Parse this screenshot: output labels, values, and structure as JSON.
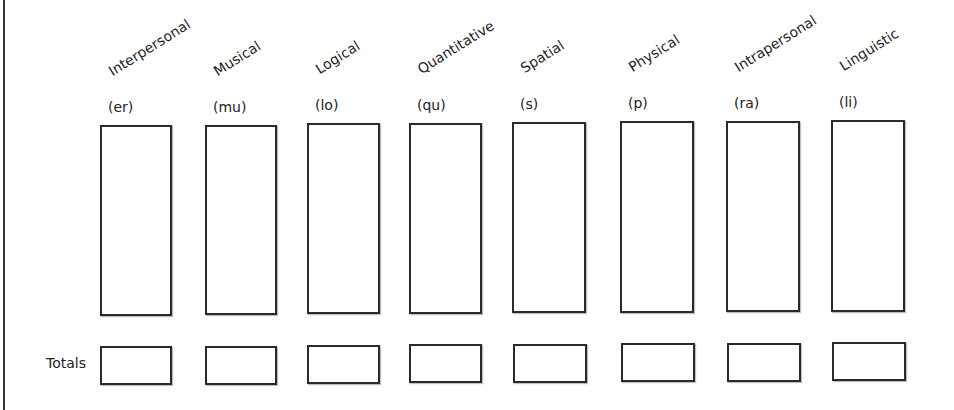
{
  "worksheet": {
    "totals_label": "Totals",
    "categories": [
      {
        "name": "Interpersonal",
        "abbr": "(er)",
        "x": 100,
        "w": 72,
        "top": 125,
        "bottom": 316,
        "tx": 100,
        "ty": 346
      },
      {
        "name": "Musical",
        "abbr": "(mu)",
        "x": 205,
        "w": 72,
        "top": 125,
        "bottom": 315,
        "tx": 205,
        "ty": 346
      },
      {
        "name": "Logical",
        "abbr": "(lo)",
        "x": 307,
        "w": 73,
        "top": 123,
        "bottom": 314,
        "tx": 307,
        "ty": 345
      },
      {
        "name": "Quantitative",
        "abbr": "(qu)",
        "x": 409,
        "w": 73,
        "top": 123,
        "bottom": 314,
        "tx": 409,
        "ty": 344
      },
      {
        "name": "Spatial",
        "abbr": "(s)",
        "x": 512,
        "w": 74,
        "top": 122,
        "bottom": 313,
        "tx": 513,
        "ty": 344
      },
      {
        "name": "Physical",
        "abbr": "(p)",
        "x": 620,
        "w": 74,
        "top": 121,
        "bottom": 313,
        "tx": 621,
        "ty": 343
      },
      {
        "name": "Intrapersonal",
        "abbr": "(ra)",
        "x": 726,
        "w": 74,
        "top": 121,
        "bottom": 312,
        "tx": 727,
        "ty": 343
      },
      {
        "name": "Linguistic",
        "abbr": "(li)",
        "x": 831,
        "w": 74,
        "top": 120,
        "bottom": 312,
        "tx": 832,
        "ty": 342
      }
    ],
    "score_values": [
      "",
      "",
      "",
      "",
      "",
      "",
      "",
      ""
    ],
    "total_values": [
      "",
      "",
      "",
      "",
      "",
      "",
      "",
      ""
    ]
  }
}
